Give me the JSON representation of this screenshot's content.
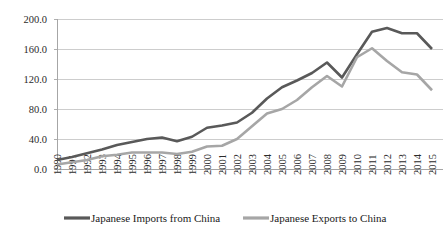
{
  "chart_data": {
    "type": "line",
    "title": "",
    "xlabel": "",
    "ylabel": "",
    "ylim": [
      0.0,
      200.0
    ],
    "yticks": [
      "0.0",
      "40.0",
      "80.0",
      "120.0",
      "160.0",
      "200.0"
    ],
    "ytick_values": [
      0.0,
      40.0,
      80.0,
      120.0,
      160.0,
      200.0
    ],
    "grid": true,
    "legend_position": "bottom",
    "categories": [
      "1990",
      "1991",
      "1992",
      "1993",
      "1994",
      "1995",
      "1996",
      "1997",
      "1998",
      "1999",
      "2000",
      "2001",
      "2002",
      "2003",
      "2004",
      "2005",
      "2006",
      "2007",
      "2008",
      "2009",
      "2010",
      "2011",
      "2012",
      "2013",
      "2014",
      "2015"
    ],
    "series": [
      {
        "name": "Japanese Imports from China",
        "color": "#595959",
        "values": [
          12.0,
          16.0,
          21.0,
          26.0,
          32.0,
          36.0,
          40.0,
          42.0,
          37.0,
          43.0,
          55.0,
          58.0,
          62.0,
          75.0,
          94.0,
          109.0,
          118.0,
          128.0,
          142.0,
          122.0,
          153.0,
          183.0,
          188.0,
          181.0,
          181.0,
          160.0
        ]
      },
      {
        "name": "Japanese Exports to China",
        "color": "#a6a6a6",
        "values": [
          6.0,
          9.0,
          12.0,
          17.0,
          19.0,
          22.0,
          22.0,
          22.0,
          20.0,
          23.0,
          30.0,
          31.0,
          40.0,
          57.0,
          74.0,
          80.0,
          92.0,
          109.0,
          124.0,
          110.0,
          149.0,
          161.0,
          144.0,
          129.0,
          126.0,
          105.0
        ]
      }
    ]
  },
  "legend": {
    "items": [
      {
        "label": "Japanese Imports from China",
        "color": "#595959"
      },
      {
        "label": "Japanese Exports to China",
        "color": "#a6a6a6"
      }
    ]
  }
}
